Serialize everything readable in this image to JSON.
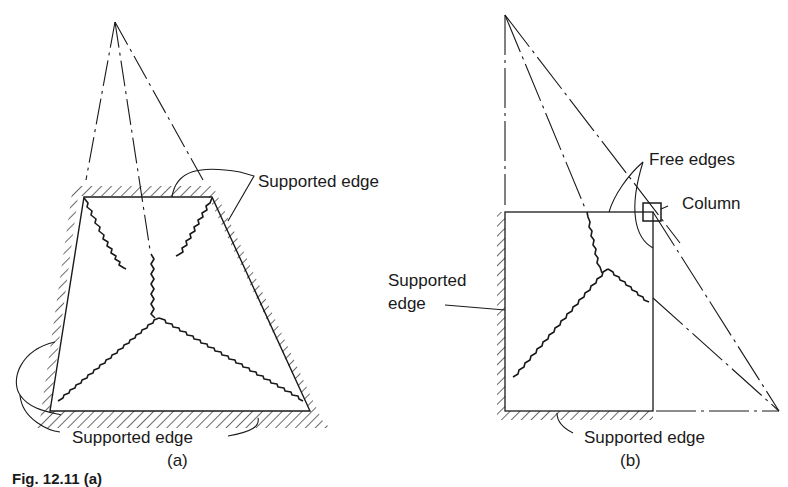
{
  "figure": {
    "caption_partial": "Fig. 12.11 (a)",
    "panel_a": {
      "label": "(a)",
      "annotations": {
        "top_right": "Supported edge",
        "bottom": "Supported edge"
      }
    },
    "panel_b": {
      "label": "(b)",
      "annotations": {
        "free_edges": "Free edges",
        "column": "Column",
        "left_line1": "Supported",
        "left_line2": "edge",
        "bottom": "Supported edge"
      }
    }
  },
  "colors": {
    "line": "#1a1a1a",
    "background": "#ffffff"
  }
}
